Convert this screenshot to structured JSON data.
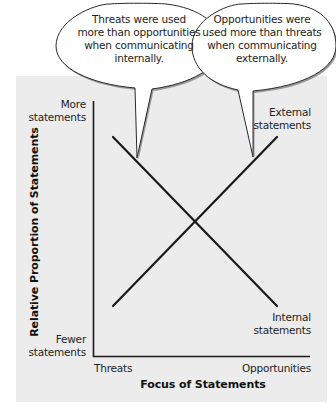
{
  "diagram": {
    "type": "crossing-lines-conceptual-chart",
    "y_axis": {
      "label": "Relative Proportion of Statements",
      "top_label": [
        "More",
        "statements"
      ],
      "bottom_label": [
        "Fewer",
        "statements"
      ]
    },
    "x_axis": {
      "label": "Focus of Statements",
      "left_label": "Threats",
      "right_label": "Opportunities"
    },
    "lines": [
      {
        "name": "Internal statements",
        "label": [
          "Internal",
          "statements"
        ],
        "direction": "decreasing",
        "start": "high at Threats",
        "end": "low at Opportunities"
      },
      {
        "name": "External statements",
        "label": [
          "External",
          "statements"
        ],
        "direction": "increasing",
        "start": "low at Threats",
        "end": "high at Opportunities"
      }
    ],
    "callouts": [
      {
        "id": "internal",
        "lines": [
          "Threats were used",
          "more than opportunities",
          "when communicating",
          "internally."
        ]
      },
      {
        "id": "external",
        "lines": [
          "Opportunities were",
          "used more than threats",
          "when communicating",
          "externally."
        ]
      }
    ],
    "colors": {
      "panel": "#ececec",
      "line": "#1a1a1a",
      "bubble_fill": "#ffffff",
      "bubble_shadow": "#9a9a9a"
    }
  }
}
